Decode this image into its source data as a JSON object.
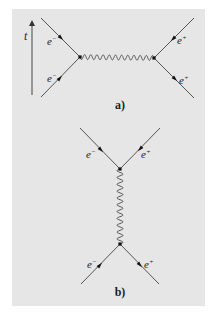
{
  "colors": {
    "background": "#ffffff",
    "panel": "#e6e6e6",
    "line": "#555555",
    "photon": "#4a4a4a",
    "vertex": "#111111",
    "text": "#222222"
  },
  "time_axis": {
    "label": "t",
    "x": 32,
    "y_start": 95,
    "y_end": 20,
    "label_x": 24,
    "label_y": 40
  },
  "diagrams": [
    {
      "id": "a",
      "caption": "a)",
      "caption_x": 120,
      "caption_y": 109,
      "vertices": [
        {
          "x": 80,
          "y": 57
        },
        {
          "x": 154,
          "y": 58
        }
      ],
      "photon": {
        "x1": 80,
        "y1": 57,
        "x2": 154,
        "y2": 58,
        "periods": 12,
        "amplitude": 2.5
      },
      "fermions": [
        {
          "name": "electron-outgoing",
          "x1": 80,
          "y1": 57,
          "x2": 41,
          "y2": 18,
          "arrow_x": 61,
          "arrow_y": 38,
          "arrow_dir": "toward-vertex",
          "label_base": "e",
          "label_sup": "−",
          "label_x": 47,
          "label_y": 45
        },
        {
          "name": "electron-incoming",
          "x1": 41,
          "y1": 97,
          "x2": 80,
          "y2": 57,
          "arrow_x": 60,
          "arrow_y": 78,
          "arrow_dir": "toward-vertex",
          "label_base": "e",
          "label_sup": "−",
          "label_x": 47,
          "label_y": 82
        },
        {
          "name": "positron-outgoing",
          "x1": 154,
          "y1": 58,
          "x2": 194,
          "y2": 18,
          "arrow_x": 173,
          "arrow_y": 39,
          "arrow_dir": "toward-vertex",
          "label_base": "e",
          "label_sup": "+",
          "label_x": 177,
          "label_y": 44
        },
        {
          "name": "positron-incoming",
          "x1": 194,
          "y1": 98,
          "x2": 154,
          "y2": 58,
          "arrow_x": 175,
          "arrow_y": 79,
          "arrow_dir": "away-from-vertex",
          "label_base": "e",
          "label_sup": "+",
          "label_x": 179,
          "label_y": 84
        }
      ]
    },
    {
      "id": "b",
      "caption": "b)",
      "caption_x": 120,
      "caption_y": 296,
      "vertices": [
        {
          "x": 120,
          "y": 169
        },
        {
          "x": 120,
          "y": 244
        }
      ],
      "photon": {
        "x1": 120,
        "y1": 169,
        "x2": 120,
        "y2": 244,
        "periods": 11,
        "amplitude": 3
      },
      "fermions": [
        {
          "name": "electron-outgoing",
          "x1": 120,
          "y1": 169,
          "x2": 80,
          "y2": 128,
          "arrow_x": 101,
          "arrow_y": 150,
          "arrow_dir": "toward-vertex",
          "label_base": "e",
          "label_sup": "−",
          "label_x": 86,
          "label_y": 158
        },
        {
          "name": "positron-outgoing",
          "x1": 120,
          "y1": 169,
          "x2": 160,
          "y2": 128,
          "arrow_x": 140,
          "arrow_y": 149,
          "arrow_dir": "toward-vertex",
          "label_base": "e",
          "label_sup": "+",
          "label_x": 141,
          "label_y": 158
        },
        {
          "name": "electron-incoming",
          "x1": 81,
          "y1": 284,
          "x2": 120,
          "y2": 244,
          "arrow_x": 100,
          "arrow_y": 265,
          "arrow_dir": "toward-vertex",
          "label_base": "e",
          "label_sup": "−",
          "label_x": 87,
          "label_y": 268
        },
        {
          "name": "positron-incoming",
          "x1": 159,
          "y1": 284,
          "x2": 120,
          "y2": 244,
          "arrow_x": 140,
          "arrow_y": 265,
          "arrow_dir": "away-from-vertex",
          "label_base": "e",
          "label_sup": "+",
          "label_x": 144,
          "label_y": 268
        }
      ]
    }
  ]
}
